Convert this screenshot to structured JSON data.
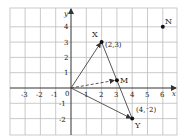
{
  "axes": {
    "x_label": "x",
    "y_label": "y",
    "origin_label": "0",
    "x_ticks": [
      "-3",
      "-2",
      "-1",
      "1",
      "2",
      "3",
      "4",
      "5",
      "6"
    ],
    "y_ticks": [
      "-2",
      "-1",
      "1",
      "2",
      "3",
      "4"
    ]
  },
  "points": {
    "X": {
      "label": "X",
      "coord_label": "(2,3)",
      "x": 2,
      "y": 3
    },
    "Y": {
      "label": "Y",
      "coord_label": "(4,⁻2)",
      "x": 4,
      "y": -2
    },
    "M": {
      "label": "M",
      "x": 3,
      "y": 0.5
    },
    "N": {
      "label": "N",
      "x": 6,
      "y": 4
    }
  },
  "colors": {
    "grid": "#b8b8b8",
    "axis": "#333333",
    "line": "#444444"
  }
}
